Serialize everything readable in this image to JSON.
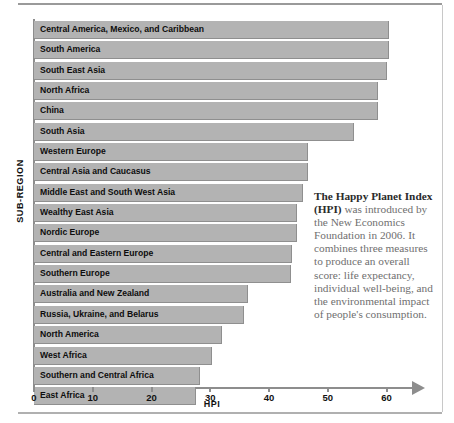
{
  "chart_data": {
    "type": "bar",
    "orientation": "horizontal",
    "title": "",
    "xlabel": "HPI",
    "ylabel": "SUB-REGION",
    "xlim": [
      0,
      65
    ],
    "xticks": [
      0,
      10,
      20,
      30,
      40,
      50,
      60
    ],
    "grid": false,
    "legend": null,
    "bar_color": "#b3b3b3",
    "categories": [
      "Central America, Mexico, and Caribbean",
      "South America",
      "South East Asia",
      "North Africa",
      "China",
      "South Asia",
      "Western Europe",
      "Central Asia and Caucasus",
      "Middle East and South West Asia",
      "Wealthy East Asia",
      "Nordic Europe",
      "Central and Eastern Europe",
      "Southern Europe",
      "Australia and New Zealand",
      "Russia, Ukraine, and Belarus",
      "North America",
      "West Africa",
      "Southern and Central Africa",
      "East Africa"
    ],
    "values": [
      60.3,
      60.3,
      59.9,
      58.3,
      58.3,
      54.3,
      46.5,
      46.5,
      45.6,
      44.5,
      44.5,
      43.8,
      43.6,
      36.3,
      35.5,
      31.8,
      30.2,
      28.0,
      27.4
    ]
  },
  "note": {
    "bold_lead": "The Happy Planet Index (HPI)",
    "rest": " was introduced by the New Economics Foundation in 2006. It combines three measures to produce an overall score: life expectancy, individual well-being, and the environmental impact of people's consumption."
  }
}
